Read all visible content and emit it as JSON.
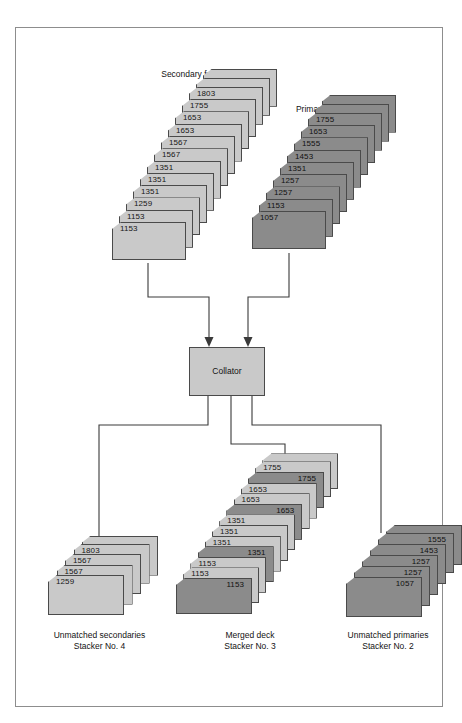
{
  "diagram": {
    "colors": {
      "light_card": "#c9c9c9",
      "dark_card": "#8b8b8b",
      "card_border": "#4a4a4a",
      "line": "#3a3a3a",
      "frame_border": "#8d8d8d",
      "background": "#ffffff"
    }
  },
  "feeds": {
    "secondary": {
      "label": "Secondary feed",
      "shade": "light",
      "cards": [
        "1803",
        "1755",
        "1653",
        "1653",
        "1567",
        "1567",
        "1351",
        "1351",
        "1351",
        "1259",
        "1153",
        "1153"
      ]
    },
    "primary": {
      "label": "Primary feed",
      "shade": "dark",
      "cards": [
        "1755",
        "1653",
        "1555",
        "1453",
        "1351",
        "1257",
        "1257",
        "1153",
        "1057"
      ]
    }
  },
  "collator": {
    "label": "Collator"
  },
  "outputs": {
    "unmatched_secondaries": {
      "label_line1": "Unmatched secondaries",
      "label_line2": "Stacker No. 4",
      "shade": "light",
      "cards": [
        "1803",
        "1567",
        "1567",
        "1259"
      ]
    },
    "merged_deck": {
      "label_line1": "Merged deck",
      "label_line2": "Stacker No. 3",
      "cards": [
        {
          "value": "1755",
          "shade": "light"
        },
        {
          "value": "1755",
          "shade": "dark"
        },
        {
          "value": "1653",
          "shade": "light"
        },
        {
          "value": "1653",
          "shade": "light"
        },
        {
          "value": "1653",
          "shade": "dark"
        },
        {
          "value": "1351",
          "shade": "light"
        },
        {
          "value": "1351",
          "shade": "light"
        },
        {
          "value": "1351",
          "shade": "light"
        },
        {
          "value": "1351",
          "shade": "dark"
        },
        {
          "value": "1153",
          "shade": "light"
        },
        {
          "value": "1153",
          "shade": "light"
        },
        {
          "value": "1153",
          "shade": "dark"
        }
      ]
    },
    "unmatched_primaries": {
      "label_line1": "Unmatched primaries",
      "label_line2": "Stacker No. 2",
      "shade": "dark",
      "cards": [
        "1555",
        "1453",
        "1257",
        "1257",
        "1057"
      ]
    }
  }
}
